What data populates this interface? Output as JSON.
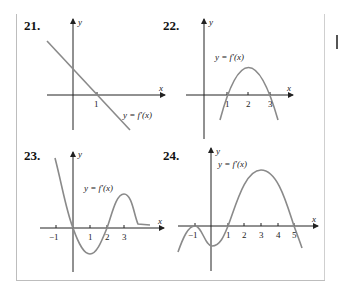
{
  "problems": [
    {
      "number": "21.",
      "curve_label": "y = f′(x)",
      "x_axis": "x",
      "y_axis": "y",
      "ticks": [
        "1"
      ]
    },
    {
      "number": "22.",
      "curve_label": "y = f′(x)",
      "x_axis": "x",
      "y_axis": "y",
      "ticks": [
        "1",
        "2",
        "3"
      ]
    },
    {
      "number": "23.",
      "curve_label": "y = f′(x)",
      "x_axis": "x",
      "y_axis": "y",
      "ticks": [
        "−1",
        "1",
        "2",
        "3"
      ]
    },
    {
      "number": "24.",
      "curve_label": "y = f′(x)",
      "x_axis": "x",
      "y_axis": "y",
      "ticks": [
        "−1",
        "1",
        "2",
        "3",
        "4",
        "5"
      ]
    }
  ],
  "colors": {
    "curve": "#8a8a8a",
    "axis": "#222222"
  }
}
